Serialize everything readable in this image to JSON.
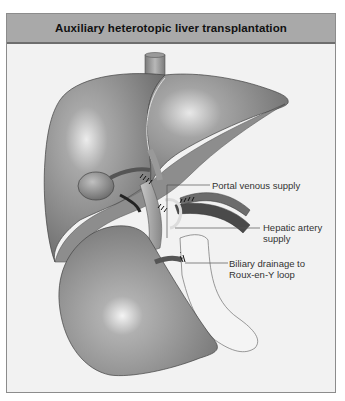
{
  "figure": {
    "title": "Auxiliary heterotopic liver transplantation",
    "labels": {
      "portal": "Portal venous supply",
      "hepatic_line1": "Hepatic artery",
      "hepatic_line2": "supply",
      "biliary_line1": "Biliary drainage to",
      "biliary_line2": "Roux-en-Y loop"
    },
    "structures": [
      "native-liver",
      "inferior-vena-cava",
      "gallbladder",
      "auxiliary-liver-graft",
      "portal-vein",
      "hepatic-artery",
      "bile-duct",
      "roux-en-y-bowel-loop"
    ],
    "colors": {
      "title_bar": "#a9a9a9",
      "background": "#f2f2f2",
      "organ": "#8a8a8a",
      "organ_highlight": "#e6e6e6",
      "vessel_dark": "#555555",
      "bowel_outline": "#707070"
    }
  }
}
